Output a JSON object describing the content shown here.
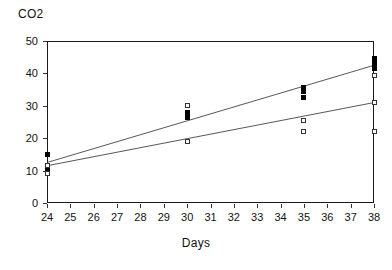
{
  "chart_data": {
    "type": "scatter",
    "title": "",
    "xlabel": "Days",
    "ylabel": "CO2",
    "xlim": [
      24,
      38
    ],
    "ylim": [
      0,
      50
    ],
    "grid": false,
    "legend": "none",
    "xticks": [
      24,
      25,
      26,
      27,
      28,
      29,
      30,
      31,
      32,
      33,
      34,
      35,
      36,
      37,
      38
    ],
    "yticks": [
      0,
      10,
      20,
      30,
      40,
      50
    ],
    "series": [
      {
        "name": "filled",
        "marker": "filled-square",
        "color": "#000000",
        "points": [
          {
            "x": 24,
            "y": 15
          },
          {
            "x": 24,
            "y": 11.5
          },
          {
            "x": 24,
            "y": 10.5
          },
          {
            "x": 30,
            "y": 28
          },
          {
            "x": 30,
            "y": 26.5
          },
          {
            "x": 35,
            "y": 35.5
          },
          {
            "x": 35,
            "y": 34.5
          },
          {
            "x": 35,
            "y": 32.5
          },
          {
            "x": 38,
            "y": 44.5
          },
          {
            "x": 38,
            "y": 43
          },
          {
            "x": 38,
            "y": 41.5
          }
        ]
      },
      {
        "name": "open",
        "marker": "open-square",
        "color": "#333333",
        "points": [
          {
            "x": 24,
            "y": 11.5
          },
          {
            "x": 24,
            "y": 9
          },
          {
            "x": 30,
            "y": 30
          },
          {
            "x": 30,
            "y": 19
          },
          {
            "x": 35,
            "y": 25.5
          },
          {
            "x": 35,
            "y": 22
          },
          {
            "x": 38,
            "y": 39.5
          },
          {
            "x": 38,
            "y": 31
          },
          {
            "x": 38,
            "y": 22
          }
        ]
      }
    ],
    "fit_lines": [
      {
        "name": "upper-fit",
        "x0": 24,
        "y0": 12.5,
        "x1": 38,
        "y1": 42.5
      },
      {
        "name": "lower-fit",
        "x0": 24,
        "y0": 11.5,
        "x1": 38,
        "y1": 31.0
      }
    ]
  }
}
